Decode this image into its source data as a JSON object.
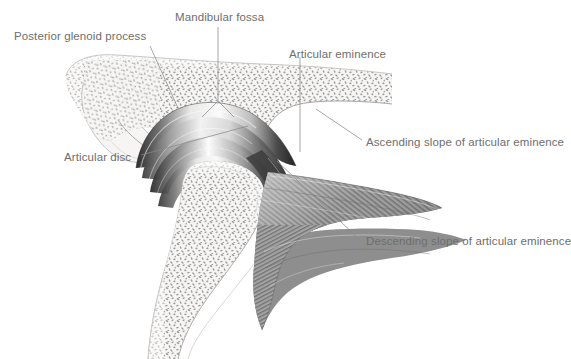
{
  "figure": {
    "type": "anatomical-illustration",
    "background_color": "#ffffff",
    "label_color": "#6e6e6e",
    "leader_color": "#8a8a8a",
    "bone_fill": "#f4f3f1",
    "bone_outline": "#b9b7b4",
    "trabecula_color": "#9a9a9c",
    "disc_dark": "#3a3a3a",
    "muscle_dark": "#4a4a4a"
  },
  "labels": [
    {
      "id": "posterior-glenoid-process",
      "text": "Posterior glenoid process",
      "x": 14,
      "y": 30,
      "align": "left"
    },
    {
      "id": "mandibular-fossa",
      "text": "Mandibular fossa",
      "x": 175,
      "y": 11,
      "align": "left"
    },
    {
      "id": "articular-eminence",
      "text": "Articular eminence",
      "x": 289,
      "y": 48,
      "align": "left"
    },
    {
      "id": "ascending-slope",
      "text": "Ascending slope of articular eminence",
      "x": 366,
      "y": 136,
      "align": "left"
    },
    {
      "id": "descending-slope",
      "text": "Descending slope of articular eminence",
      "x": 366,
      "y": 235,
      "align": "left"
    },
    {
      "id": "articular-disc",
      "text": "Articular disc",
      "x": 64,
      "y": 151,
      "align": "left"
    }
  ],
  "leaders": [
    {
      "id": "leader-posterior-glenoid-process",
      "path": "M 150 46 L 178 108"
    },
    {
      "id": "leader-mandibular-fossa-stem",
      "path": "M 218 27 L 218 101"
    },
    {
      "id": "leader-mandibular-fossa-left",
      "path": "M 218 101 L 203 116"
    },
    {
      "id": "leader-mandibular-fossa-right",
      "path": "M 218 101 L 233 116"
    },
    {
      "id": "leader-articular-eminence",
      "path": "M 300 57 L 300 152"
    },
    {
      "id": "leader-ascending-slope",
      "path": "M 318 110 L 362 140"
    },
    {
      "id": "leader-descending-slope",
      "path": "M 277 161 L 360 240"
    },
    {
      "id": "leader-articular-disc",
      "path": "M 141 155 L 245 127"
    }
  ],
  "structures": [
    {
      "id": "temporal-bone",
      "name": "Temporal bone (squamous portion)"
    },
    {
      "id": "posterior-glenoid-process-shape",
      "name": "Posterior glenoid process"
    },
    {
      "id": "mandibular-fossa-shape",
      "name": "Mandibular fossa"
    },
    {
      "id": "articular-eminence-shape",
      "name": "Articular eminence"
    },
    {
      "id": "articular-disc-shape",
      "name": "Articular disc"
    },
    {
      "id": "mandibular-condyle",
      "name": "Mandibular condyle"
    },
    {
      "id": "mandibular-ramus",
      "name": "Mandibular ramus"
    },
    {
      "id": "lateral-pterygoid-muscle",
      "name": "Lateral pterygoid muscle"
    }
  ]
}
